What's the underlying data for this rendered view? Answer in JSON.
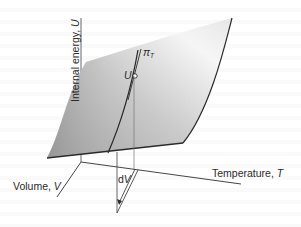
{
  "figure": {
    "surface_label": "Internal energy surface U(V,T)",
    "axes": {
      "vertical": {
        "label": "Internal energy, ",
        "symbol": "U"
      },
      "x_axis": {
        "label": "Temperature, ",
        "symbol": "T"
      },
      "depth_axis": {
        "label": "Volume, ",
        "symbol": "V"
      }
    },
    "annotations": {
      "point_label": "U",
      "slope_label": "π",
      "slope_subscript": "T",
      "step_label": "d",
      "step_symbol": "V"
    },
    "colors": {
      "surface_dark": "#a9a9a9",
      "surface_light": "#f4f4f4",
      "line": "#2b2b2b",
      "axis": "#555555",
      "background": "#ffffff"
    }
  }
}
